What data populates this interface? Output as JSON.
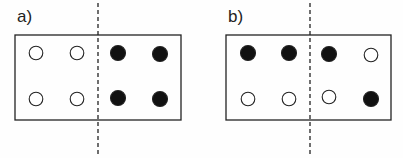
{
  "panels": [
    {
      "label": "a)",
      "box": {
        "x": 15,
        "y": 35,
        "w": 166,
        "h": 85
      },
      "divider_x": 98,
      "circles": [
        {
          "x": 36,
          "y": 53,
          "filled": false
        },
        {
          "x": 77,
          "y": 53,
          "filled": false
        },
        {
          "x": 118,
          "y": 53,
          "filled": true
        },
        {
          "x": 160,
          "y": 54,
          "filled": true
        },
        {
          "x": 36,
          "y": 99,
          "filled": false
        },
        {
          "x": 77,
          "y": 99,
          "filled": false
        },
        {
          "x": 118,
          "y": 98,
          "filled": true
        },
        {
          "x": 160,
          "y": 99,
          "filled": true
        }
      ]
    },
    {
      "label": "b)",
      "box": {
        "x": 226,
        "y": 35,
        "w": 165,
        "h": 85
      },
      "divider_x": 310,
      "circles": [
        {
          "x": 248,
          "y": 53,
          "filled": true
        },
        {
          "x": 289,
          "y": 53,
          "filled": true
        },
        {
          "x": 329,
          "y": 54,
          "filled": true
        },
        {
          "x": 371,
          "y": 55,
          "filled": false
        },
        {
          "x": 248,
          "y": 99,
          "filled": false
        },
        {
          "x": 289,
          "y": 99,
          "filled": false
        },
        {
          "x": 329,
          "y": 97,
          "filled": false
        },
        {
          "x": 371,
          "y": 99,
          "filled": true
        }
      ]
    }
  ],
  "colors": {
    "stroke": "#222222",
    "fill": "#111111",
    "background": "#fefefe"
  }
}
